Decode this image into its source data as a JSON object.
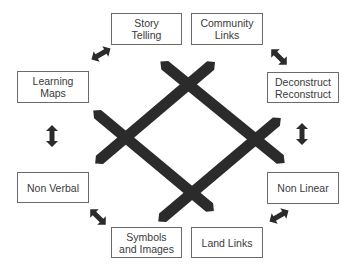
{
  "diagram": {
    "type": "concept-cycle",
    "center_graphic": "four crossed bars forming a diamond lattice",
    "colors": {
      "bar": "#2b2b2b",
      "arrow": "#2b2b2b",
      "box_border": "#6a6a6a",
      "text": "#3a3a3a",
      "background": "#ffffff"
    },
    "nodes": [
      {
        "id": "story_telling",
        "label": "Story\nTelling"
      },
      {
        "id": "community_links",
        "label": "Community\nLinks"
      },
      {
        "id": "deconstruct_reconstruct",
        "label": "Deconstruct\nReconstruct"
      },
      {
        "id": "non_linear",
        "label": "Non Linear"
      },
      {
        "id": "land_links",
        "label": "Land Links"
      },
      {
        "id": "symbols_images",
        "label": "Symbols\nand Images"
      },
      {
        "id": "non_verbal",
        "label": "Non Verbal"
      },
      {
        "id": "learning_maps",
        "label": "Learning\nMaps"
      }
    ],
    "connections": [
      {
        "from": "story_telling",
        "to": "learning_maps",
        "type": "double-arrow"
      },
      {
        "from": "community_links",
        "to": "deconstruct_reconstruct",
        "type": "double-arrow"
      },
      {
        "from": "learning_maps",
        "to": "non_verbal",
        "type": "double-arrow"
      },
      {
        "from": "deconstruct_reconstruct",
        "to": "non_linear",
        "type": "double-arrow"
      },
      {
        "from": "non_verbal",
        "to": "symbols_images",
        "type": "double-arrow"
      },
      {
        "from": "non_linear",
        "to": "land_links",
        "type": "double-arrow"
      }
    ]
  }
}
